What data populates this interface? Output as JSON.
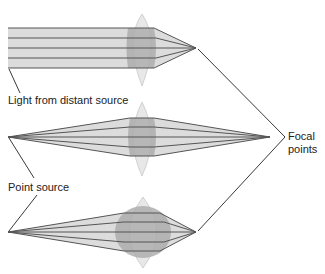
{
  "labels": {
    "distant": "Light from distant source",
    "point": "Point source",
    "focal_line1": "Focal",
    "focal_line2": "points"
  },
  "colors": {
    "beam_fill": "#d9d9d9",
    "lens_fill": "#e6e6e6",
    "overlap_fill": "#a8a8a8",
    "ray": "#555555",
    "leader": "#222222"
  },
  "panels": [
    {
      "name": "distant-source-lens",
      "source": "parallel rays",
      "lens": "thin convex"
    },
    {
      "name": "point-source-thin-lens",
      "source": "point",
      "lens": "thin convex"
    },
    {
      "name": "point-source-thick-lens",
      "source": "point",
      "lens": "thick convex"
    }
  ]
}
